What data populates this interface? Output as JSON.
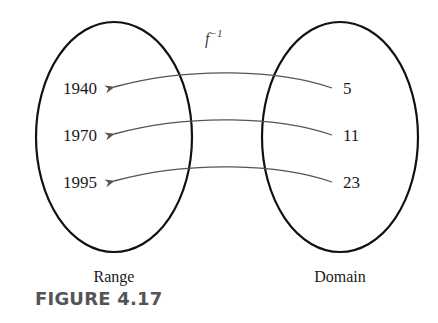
{
  "figure": {
    "caption": "FIGURE 4.17",
    "function_label": "f",
    "function_superscript": "−1",
    "left_set": {
      "label": "Range",
      "elements": [
        "1940",
        "1970",
        "1995"
      ]
    },
    "right_set": {
      "label": "Domain",
      "elements": [
        "5",
        "11",
        "23"
      ]
    },
    "mappings": [
      {
        "from": "5",
        "to": "1940"
      },
      {
        "from": "11",
        "to": "1970"
      },
      {
        "from": "23",
        "to": "1995"
      }
    ],
    "colors": {
      "ellipse": "#111111",
      "arrow": "#555555",
      "caption": "#555555"
    }
  }
}
